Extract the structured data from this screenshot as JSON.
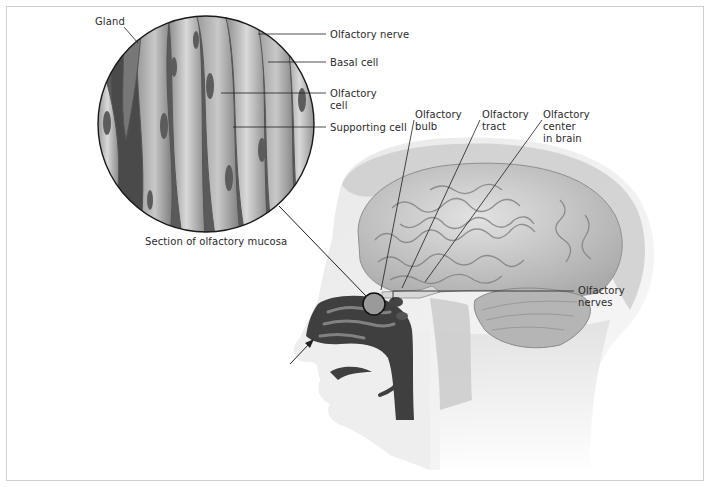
{
  "figure": {
    "border_color": "#cfcfcf",
    "ink_color": "#2a2a2a"
  },
  "inset": {
    "caption": "Section of olfactory mucosa",
    "labels": {
      "gland": "Gland",
      "olfactory_nerve": "Olfactory nerve",
      "basal_cell": "Basal cell",
      "olfactory_cell_line1": "Olfactory",
      "olfactory_cell_line2": "cell",
      "supporting_cell": "Supporting cell"
    }
  },
  "head": {
    "labels": {
      "bulb_line1": "Olfactory",
      "bulb_line2": "bulb",
      "tract_line1": "Olfactory",
      "tract_line2": "tract",
      "center_line1": "Olfactory",
      "center_line2": "center",
      "center_line3": "in brain",
      "nerves_line1": "Olfactory",
      "nerves_line2": "nerves"
    }
  }
}
